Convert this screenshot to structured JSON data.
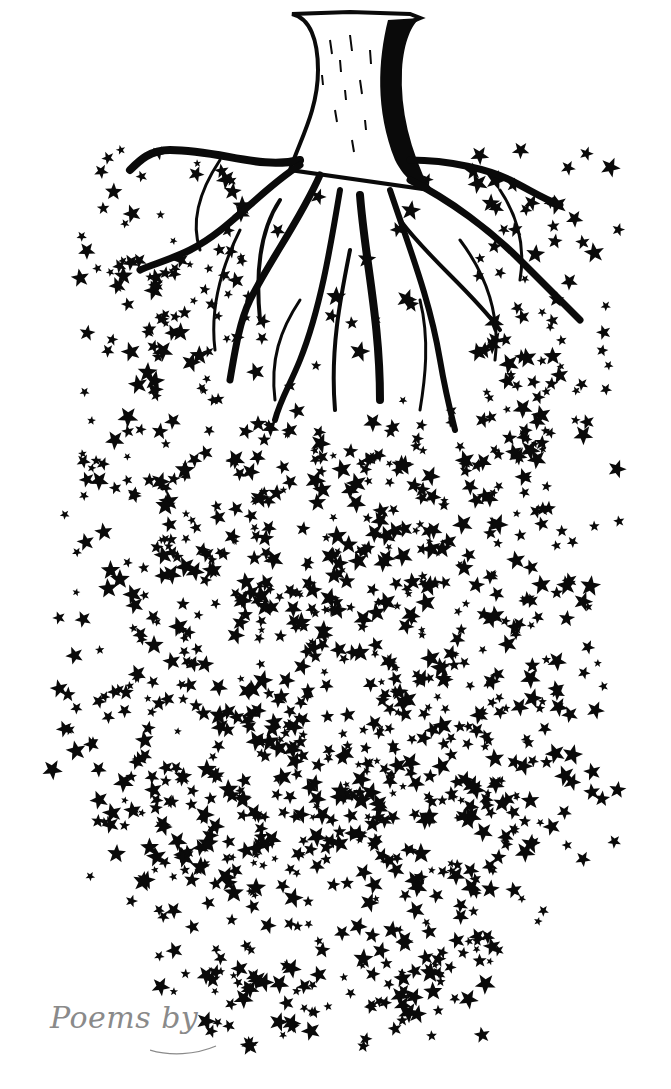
{
  "illustration": {
    "subject": "tree trunk with spreading roots dissolving into falling maple leaves",
    "style": "black ink engraving on white",
    "colors": {
      "ink": "#0a0a0a",
      "background": "#ffffff",
      "caption": "#8a8a8a"
    },
    "leaf_field": {
      "center_x": 340,
      "top_y": 150,
      "bottom_y": 1050,
      "count": 1400,
      "seed": 7
    }
  },
  "caption": {
    "text": "Poems by"
  }
}
